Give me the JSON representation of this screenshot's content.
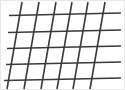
{
  "figure": {
    "name": "slanted-grid-illusion",
    "width": 125,
    "height": 90,
    "background_color": "#ffffff",
    "border_color": "#e8e8e8",
    "line_color": "#3a3a3a",
    "line_width": 1.6,
    "horizontal_line_count": 5,
    "diagonal_line_count": 6,
    "horizontal_lines": [
      {
        "id": "h1",
        "x1": 9,
        "y1": 15.5,
        "x2": 121,
        "y2": 13.0
      },
      {
        "id": "h2",
        "x1": 8,
        "y1": 32.5,
        "x2": 121,
        "y2": 30.0
      },
      {
        "id": "h3",
        "x1": 7,
        "y1": 48.5,
        "x2": 121,
        "y2": 46.0
      },
      {
        "id": "h4",
        "x1": 6,
        "y1": 64.5,
        "x2": 121,
        "y2": 62.0
      },
      {
        "id": "h5",
        "x1": 4,
        "y1": 80.5,
        "x2": 121,
        "y2": 78.0
      }
    ],
    "diagonal_lines": [
      {
        "id": "d1",
        "x1": 22,
        "y1": 2,
        "x2": 7,
        "y2": 89
      },
      {
        "id": "d2",
        "x1": 39,
        "y1": 2,
        "x2": 24,
        "y2": 89
      },
      {
        "id": "d3",
        "x1": 56,
        "y1": 2,
        "x2": 41,
        "y2": 89
      },
      {
        "id": "d4",
        "x1": 72,
        "y1": 2,
        "x2": 57,
        "y2": 89
      },
      {
        "id": "d5",
        "x1": 88,
        "y1": 2,
        "x2": 73,
        "y2": 89
      },
      {
        "id": "d6",
        "x1": 105,
        "y1": 2,
        "x2": 90,
        "y2": 89
      }
    ]
  }
}
